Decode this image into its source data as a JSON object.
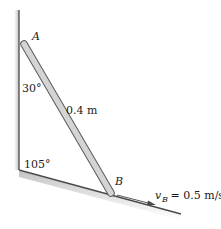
{
  "diagram": {
    "points": {
      "A": {
        "label": "A"
      },
      "B": {
        "label": "B"
      }
    },
    "rod": {
      "length_label": "0.4 m"
    },
    "angles": {
      "wall_rod": "30°",
      "wall_incline": "105°"
    },
    "velocity": {
      "symbol": "v",
      "subscript": "B",
      "value_text": " = 0.5 m/s"
    },
    "colors": {
      "rod_fill": "#d4d4d4",
      "rod_stroke": "#5a5a5a",
      "line": "#4a4a4a",
      "shadow": "#bdbdbd"
    }
  }
}
